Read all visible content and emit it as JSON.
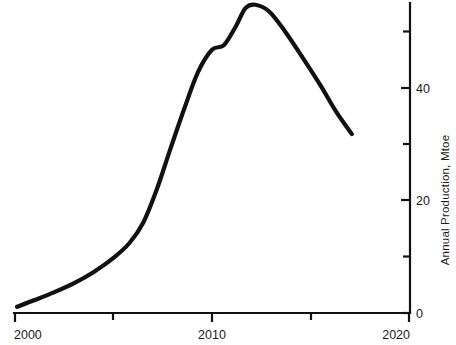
{
  "chart_data": {
    "type": "line",
    "title": "",
    "subtitle": "",
    "xlabel": "",
    "ylabel": "Annual Production, Mtoe",
    "xlim": [
      2000,
      2020
    ],
    "ylim": [
      0,
      56
    ],
    "grid": false,
    "legend": null,
    "x_ticks_major": [
      "2000",
      "2010",
      "2020"
    ],
    "x_ticks_major_values": [
      2000,
      2010,
      2020
    ],
    "x_ticks_minor_values": [
      2005,
      2015
    ],
    "y_ticks_major": [
      "0",
      "20",
      "40"
    ],
    "y_ticks_major_values": [
      0,
      20,
      40
    ],
    "y_ticks_minor_values": [
      10,
      30,
      50
    ],
    "y_axis_position": "right",
    "series": [
      {
        "name": "Annual Production",
        "color": "#111111",
        "x": [
          2000.1,
          2001.0,
          2002.0,
          2003.0,
          2004.0,
          2005.0,
          2005.8,
          2006.5,
          2007.2,
          2007.9,
          2008.6,
          2009.3,
          2010.0,
          2010.6,
          2011.2,
          2011.7,
          2012.2,
          2012.9,
          2013.7,
          2014.6,
          2015.5,
          2016.3,
          2017.1
        ],
        "y": [
          1.1,
          2.3,
          3.7,
          5.3,
          7.3,
          9.8,
          12.4,
          16.0,
          22.0,
          29.3,
          36.4,
          42.9,
          46.8,
          47.6,
          50.9,
          54.2,
          54.8,
          53.6,
          50.1,
          45.4,
          40.5,
          35.8,
          31.8
        ]
      }
    ]
  },
  "axis_labels": {
    "x_2000": "2000",
    "x_2010": "2010",
    "x_2020": "2020",
    "y_0": "0",
    "y_20": "20",
    "y_40": "40",
    "y_title": "Annual Production, Mtoe"
  }
}
